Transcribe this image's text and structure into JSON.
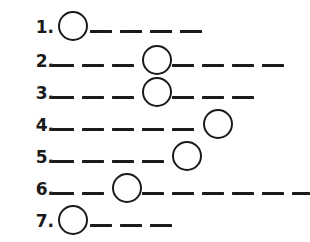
{
  "sheet": {
    "title": "Circle-on-dashed-line sequence worksheet",
    "background_color": "#ffffff",
    "ink_color": "#1a1a1a",
    "width": 310,
    "height": 242,
    "row_count": 7,
    "circle_diameter": 30,
    "dash_thickness": 3,
    "dash_length": 22,
    "dash_gap": 8
  },
  "rows": [
    {
      "number": "1.",
      "label_x": 14,
      "row_top": 10,
      "baseline_y": 30,
      "circle": {
        "x": 58,
        "y": 11,
        "d": 30
      },
      "dashes": [
        {
          "x": 90,
          "w": 22
        },
        {
          "x": 120,
          "w": 22
        },
        {
          "x": 150,
          "w": 22
        },
        {
          "x": 180,
          "w": 22
        }
      ],
      "line_end_x": 202
    },
    {
      "number": "2.",
      "label_x": 14,
      "row_top": 44,
      "baseline_y": 64,
      "circle": {
        "x": 142,
        "y": 45,
        "d": 30
      },
      "dashes": [
        {
          "x": 52,
          "w": 22
        },
        {
          "x": 82,
          "w": 22
        },
        {
          "x": 112,
          "w": 22
        },
        {
          "x": 172,
          "w": 22
        },
        {
          "x": 202,
          "w": 22
        },
        {
          "x": 232,
          "w": 22
        },
        {
          "x": 262,
          "w": 22
        }
      ],
      "line_end_x": 284
    },
    {
      "number": "3.",
      "label_x": 14,
      "row_top": 76,
      "baseline_y": 96,
      "circle": {
        "x": 142,
        "y": 77,
        "d": 30
      },
      "dashes": [
        {
          "x": 52,
          "w": 22
        },
        {
          "x": 82,
          "w": 22
        },
        {
          "x": 112,
          "w": 22
        },
        {
          "x": 172,
          "w": 22
        },
        {
          "x": 202,
          "w": 22
        },
        {
          "x": 232,
          "w": 22
        }
      ],
      "line_end_x": 254
    },
    {
      "number": "4.",
      "label_x": 14,
      "row_top": 108,
      "baseline_y": 128,
      "circle": {
        "x": 203,
        "y": 109,
        "d": 30
      },
      "dashes": [
        {
          "x": 52,
          "w": 22
        },
        {
          "x": 82,
          "w": 22
        },
        {
          "x": 112,
          "w": 22
        },
        {
          "x": 142,
          "w": 22
        },
        {
          "x": 172,
          "w": 22
        }
      ],
      "line_end_x": 233
    },
    {
      "number": "5.",
      "label_x": 14,
      "row_top": 140,
      "baseline_y": 160,
      "circle": {
        "x": 172,
        "y": 141,
        "d": 30
      },
      "dashes": [
        {
          "x": 52,
          "w": 22
        },
        {
          "x": 82,
          "w": 22
        },
        {
          "x": 112,
          "w": 22
        },
        {
          "x": 142,
          "w": 22
        }
      ],
      "line_end_x": 202
    },
    {
      "number": "6.",
      "label_x": 14,
      "row_top": 172,
      "baseline_y": 192,
      "circle": {
        "x": 112,
        "y": 173,
        "d": 30
      },
      "dashes": [
        {
          "x": 52,
          "w": 22
        },
        {
          "x": 82,
          "w": 22
        },
        {
          "x": 142,
          "w": 22
        },
        {
          "x": 172,
          "w": 22
        },
        {
          "x": 202,
          "w": 22
        },
        {
          "x": 232,
          "w": 22
        },
        {
          "x": 262,
          "w": 22
        },
        {
          "x": 292,
          "w": 18
        }
      ],
      "line_end_x": 310
    },
    {
      "number": "7.",
      "label_x": 14,
      "row_top": 204,
      "baseline_y": 224,
      "circle": {
        "x": 58,
        "y": 205,
        "d": 30
      },
      "dashes": [
        {
          "x": 90,
          "w": 22
        },
        {
          "x": 120,
          "w": 22
        },
        {
          "x": 150,
          "w": 22
        }
      ],
      "line_end_x": 172
    }
  ]
}
